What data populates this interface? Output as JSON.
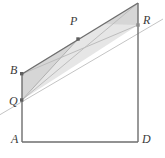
{
  "figure": {
    "background_color": "#ffffff",
    "stroke_dark": "#6b6b6b",
    "stroke_light": "#b5b5b5",
    "stroke_faint": "#c9c9c9",
    "shade_fill": "#d9d9d9",
    "shade_fill_light": "#e4e4e4",
    "label_color": "#3a3a3a",
    "point_color": "#6b6b6b"
  },
  "labels": {
    "A": "A",
    "B": "B",
    "D": "D",
    "P": "P",
    "Q": "Q",
    "R": "R"
  },
  "points": {
    "A": {
      "x": 22,
      "y": 142,
      "label": "A",
      "label_x": 11,
      "label_y": 138,
      "marked": false
    },
    "B": {
      "x": 22,
      "y": 74,
      "label": "B",
      "label_x": 10,
      "label_y": 64,
      "marked": true
    },
    "D": {
      "x": 138,
      "y": 142,
      "label": "D",
      "label_x": 142,
      "label_y": 138,
      "marked": false
    },
    "P": {
      "x": 78,
      "y": 39,
      "label": "P",
      "label_x": 70,
      "label_y": 16,
      "marked": true
    },
    "Q": {
      "x": 22,
      "y": 100,
      "label": "Q",
      "label_x": 9,
      "label_y": 97,
      "marked": true
    },
    "R": {
      "x": 138,
      "y": 25,
      "label": "R",
      "label_x": 142,
      "label_y": 16,
      "marked": true
    },
    "apex": {
      "x": 138,
      "y": 3,
      "label": "",
      "marked": false
    }
  },
  "segments": [
    {
      "name": "base-AD",
      "x1": 22,
      "y1": 142,
      "x2": 138,
      "y2": 142,
      "weight": "dark"
    },
    {
      "name": "left-side-BA",
      "x1": 22,
      "y1": 74,
      "x2": 22,
      "y2": 142,
      "weight": "dark"
    },
    {
      "name": "right-side-apex-D",
      "x1": 138,
      "y1": 3,
      "x2": 138,
      "y2": 142,
      "weight": "dark"
    },
    {
      "name": "upper-line-B-apex",
      "x1": 22,
      "y1": 74,
      "x2": 138,
      "y2": 3,
      "weight": "dark"
    },
    {
      "name": "line-Q-R-extended",
      "x1": -4,
      "y1": 117,
      "x2": 163,
      "y2": 19,
      "weight": "light"
    },
    {
      "name": "line-B-R",
      "x1": 22,
      "y1": 74,
      "x2": 138,
      "y2": 25,
      "weight": "light"
    },
    {
      "name": "line-Q-apex",
      "x1": 22,
      "y1": 100,
      "x2": 138,
      "y2": 3,
      "weight": "light"
    },
    {
      "name": "line-Q-P",
      "x1": 22,
      "y1": 100,
      "x2": 78,
      "y2": 39,
      "weight": "light"
    }
  ],
  "shaded_regions": [
    {
      "name": "region-B-Q-P",
      "tone": "mid",
      "polygon": "22,74 22,100 78,39"
    },
    {
      "name": "region-apex-R-upper",
      "tone": "mid",
      "polygon": "138,3 138,25 104,24"
    },
    {
      "name": "region-band-B-apex-R-Q",
      "tone": "light",
      "polygon": "22,74 138,3 138,25 22,100"
    }
  ]
}
